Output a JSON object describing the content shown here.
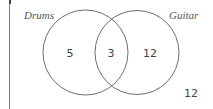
{
  "diagram": {
    "type": "venn",
    "sets": [
      {
        "label": "Drums",
        "only_value": "5"
      },
      {
        "label": "Guitar",
        "only_value": "12"
      }
    ],
    "intersection_value": "3",
    "outside_value": "12",
    "colors": {
      "stroke": "#6e6e6e",
      "text": "#444444",
      "frame": "#7a7a7a"
    }
  }
}
